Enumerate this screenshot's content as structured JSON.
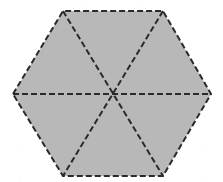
{
  "figure": {
    "name": "regular-hexagon-divided-into-six-triangles",
    "shape": "hexagon",
    "orientation": "pointy-left-right-flat-top-bottom",
    "canvas": {
      "width": 223,
      "height": 182
    },
    "center": {
      "x": 112,
      "y": 94
    },
    "fill_color": "#b8b8b8",
    "background_color": "#ffffff",
    "stroke_color": "#2a2a2a",
    "stroke_width": 2,
    "stroke_style": "dashed",
    "dash_pattern": "6 3",
    "vertex_count": 6,
    "triangle_count": 6,
    "vertices": [
      {
        "label": "left",
        "x": 13,
        "y": 94
      },
      {
        "label": "top-left",
        "x": 63,
        "y": 11
      },
      {
        "label": "top-right",
        "x": 163,
        "y": 11
      },
      {
        "label": "right",
        "x": 211,
        "y": 94
      },
      {
        "label": "bottom-right",
        "x": 163,
        "y": 176
      },
      {
        "label": "bottom-left",
        "x": 63,
        "y": 176
      }
    ],
    "outline_points": "13,94 63,11 163,11 211,94 163,176 63,176",
    "diagonals": [
      {
        "label": "left-to-right-diagonal",
        "x1": 13,
        "y1": 94,
        "x2": 211,
        "y2": 94
      },
      {
        "label": "top-left-to-bottom-right-diagonal",
        "x1": 63,
        "y1": 11,
        "x2": 163,
        "y2": 176
      },
      {
        "label": "top-right-to-bottom-left-diagonal",
        "x1": 163,
        "y1": 11,
        "x2": 63,
        "y2": 176
      }
    ]
  }
}
